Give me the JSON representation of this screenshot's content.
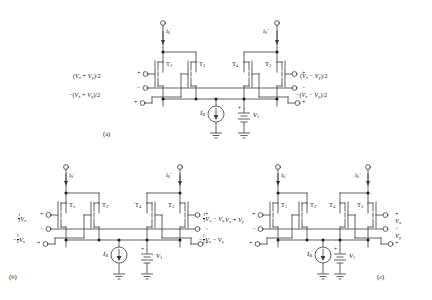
{
  "figure": {
    "panels": [
      {
        "id": "a",
        "tag": "(a)",
        "currents": [
          {
            "name": "i0p",
            "label": "i",
            "sub": "0",
            "sup": "+",
            "direction": "down"
          },
          {
            "name": "i0m",
            "label": "i",
            "sub": "0",
            "sup": "−",
            "direction": "down"
          }
        ],
        "transistors": [
          "T1",
          "T2",
          "T4",
          "T3"
        ],
        "transistor_labels": [
          "T",
          "T",
          "T",
          "T"
        ],
        "transistor_subs": [
          "1",
          "2",
          "4",
          "3"
        ],
        "left_terminals": [
          {
            "polarity": "+",
            "signal": ""
          },
          {
            "polarity": "−",
            "signal": "(Vx + Vy)/2"
          },
          {
            "polarity": "+",
            "signal": "−(Vx + Vy)/2"
          }
        ],
        "right_terminals": [
          {
            "polarity": "+",
            "signal": "(Vx − Vy)/2"
          },
          {
            "polarity": "−",
            "signal": ""
          },
          {
            "polarity": "+",
            "signal": "−(Vx − Vy)/2"
          }
        ],
        "sources": [
          {
            "name": "current-source",
            "label": "I",
            "sub": "B"
          },
          {
            "name": "voltage-source",
            "label": "V",
            "sub": "1"
          }
        ]
      },
      {
        "id": "b",
        "tag": "(b)",
        "currents": [
          {
            "name": "i0p",
            "label": "i",
            "sub": "0",
            "sup": "+",
            "direction": "down"
          },
          {
            "name": "i0m",
            "label": "i",
            "sub": "0",
            "sup": "−",
            "direction": "down"
          }
        ],
        "transistor_subs": [
          "1",
          "2",
          "4",
          "3"
        ],
        "left_signals": [
          "½ Vx",
          "−½ Vx"
        ],
        "right_signals": [
          "½ Vx − Vy",
          "−½ Vx − Vy"
        ],
        "sources": [
          {
            "name": "current-source",
            "label": "I",
            "sub": "B"
          },
          {
            "name": "voltage-source",
            "label": "V",
            "sub": "1"
          }
        ]
      },
      {
        "id": "c",
        "tag": "(c)",
        "currents": [
          {
            "name": "i0p",
            "label": "i",
            "sub": "0",
            "sup": "+",
            "direction": "down"
          },
          {
            "name": "i0m",
            "label": "i",
            "sub": "0",
            "sup": "−",
            "direction": "down"
          }
        ],
        "transistor_subs": [
          "1",
          "2",
          "4",
          "3"
        ],
        "left_signals": [
          "Vx + Vy"
        ],
        "right_signals": [
          "Vx",
          "Vy"
        ],
        "sources": [
          {
            "name": "current-source",
            "label": "I",
            "sub": "B"
          },
          {
            "name": "voltage-source",
            "label": "V",
            "sub": "1"
          }
        ]
      }
    ],
    "symbols": {
      "plus": "+",
      "minus": "−",
      "V": "V",
      "I": "I",
      "i": "i",
      "T": "T",
      "x": "x",
      "y": "y",
      "B": "B",
      "one": "1",
      "two": "2",
      "zero": "0",
      "three": "3",
      "four": "4",
      "slash2": "/2",
      "paren_open": "(",
      "paren_close": ")"
    },
    "colors": {
      "wire": "#3a3a3a",
      "text": "#1a1a1a",
      "background": "#ffffff",
      "node": "#1a1a1a"
    }
  }
}
